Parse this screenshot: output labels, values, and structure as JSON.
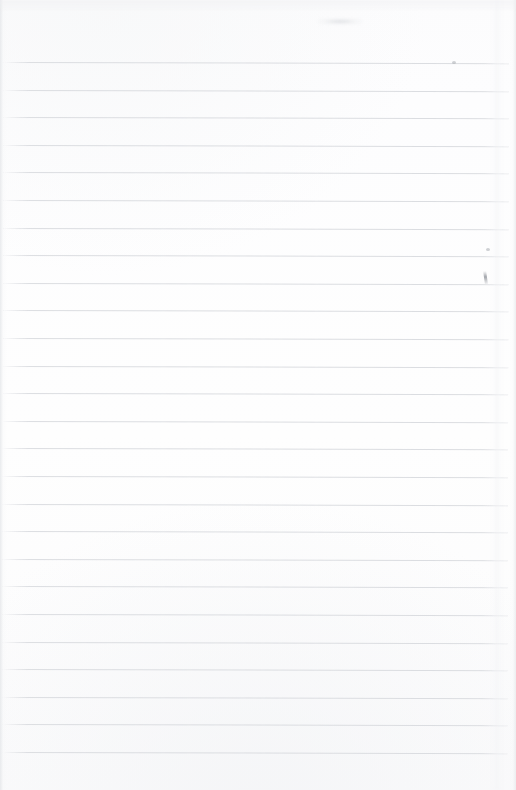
{
  "document": {
    "kind": "scanned-lined-paper",
    "title": "Blank Ruled Notepad Page",
    "page_width": 516,
    "page_height": 790,
    "orientation": "portrait",
    "content_text": "",
    "is_blank": true,
    "writing_present": false
  },
  "paper": {
    "background_color": "#fdfdfe",
    "edge_shadow_color": "#e4e6e9",
    "top_margin_px": 62,
    "bottom_margin_px": 38,
    "left_inset_px": 4,
    "right_inset_px": 7
  },
  "ruling": {
    "style": "horizontal-ruled",
    "line_color": "#d9dbdf",
    "line_thickness_px": 1,
    "line_spacing_px": 27.6,
    "line_count": 26,
    "first_line_y": 62,
    "last_line_y": 752,
    "line_start_x": 4,
    "line_end_x": 509,
    "skew_degrees": 0.13,
    "margin_rule_present": false,
    "lines": [
      {
        "index": 1,
        "y": 62.0,
        "x1": 4,
        "x2": 509
      },
      {
        "index": 2,
        "y": 89.6,
        "x1": 4,
        "x2": 509
      },
      {
        "index": 3,
        "y": 117.2,
        "x1": 4,
        "x2": 509
      },
      {
        "index": 4,
        "y": 144.8,
        "x1": 4,
        "x2": 509
      },
      {
        "index": 5,
        "y": 172.4,
        "x1": 4,
        "x2": 509
      },
      {
        "index": 6,
        "y": 200.0,
        "x1": 4,
        "x2": 509
      },
      {
        "index": 7,
        "y": 227.6,
        "x1": 4,
        "x2": 509
      },
      {
        "index": 8,
        "y": 255.2,
        "x1": 4,
        "x2": 509
      },
      {
        "index": 9,
        "y": 282.8,
        "x1": 4,
        "x2": 509
      },
      {
        "index": 10,
        "y": 310.4,
        "x1": 4,
        "x2": 509
      },
      {
        "index": 11,
        "y": 338.0,
        "x1": 4,
        "x2": 509
      },
      {
        "index": 12,
        "y": 365.6,
        "x1": 4,
        "x2": 509
      },
      {
        "index": 13,
        "y": 393.2,
        "x1": 4,
        "x2": 509
      },
      {
        "index": 14,
        "y": 420.8,
        "x1": 4,
        "x2": 509
      },
      {
        "index": 15,
        "y": 448.4,
        "x1": 4,
        "x2": 509
      },
      {
        "index": 16,
        "y": 476.0,
        "x1": 4,
        "x2": 509
      },
      {
        "index": 17,
        "y": 503.6,
        "x1": 4,
        "x2": 509
      },
      {
        "index": 18,
        "y": 531.2,
        "x1": 4,
        "x2": 509
      },
      {
        "index": 19,
        "y": 558.8,
        "x1": 4,
        "x2": 509
      },
      {
        "index": 20,
        "y": 586.4,
        "x1": 4,
        "x2": 509
      },
      {
        "index": 21,
        "y": 614.0,
        "x1": 4,
        "x2": 509
      },
      {
        "index": 22,
        "y": 641.6,
        "x1": 4,
        "x2": 509
      },
      {
        "index": 23,
        "y": 669.2,
        "x1": 4,
        "x2": 509
      },
      {
        "index": 24,
        "y": 696.8,
        "x1": 4,
        "x2": 509
      },
      {
        "index": 25,
        "y": 724.4,
        "x1": 4,
        "x2": 509
      },
      {
        "index": 26,
        "y": 752.0,
        "x1": 4,
        "x2": 509
      }
    ]
  },
  "artifacts": [
    {
      "id": "top-ghost-band",
      "type": "scan-ghosting",
      "x": 0,
      "y": 0,
      "w": 516,
      "h": 12
    },
    {
      "id": "top-smudge",
      "type": "smudge",
      "x": 318,
      "y": 18,
      "w": 44,
      "h": 7
    },
    {
      "id": "pen-tick-right",
      "type": "pen-mark",
      "x": 484,
      "y": 271,
      "w": 3,
      "h": 13
    },
    {
      "id": "dot-right-upper",
      "type": "speck",
      "x": 486,
      "y": 248,
      "w": 4,
      "h": 3
    },
    {
      "id": "dot-top-right",
      "type": "speck",
      "x": 452,
      "y": 61,
      "w": 4,
      "h": 3
    },
    {
      "id": "fold-hint-right",
      "type": "fold-shading",
      "x": 492,
      "y": 0,
      "w": 10,
      "h": 790
    }
  ]
}
